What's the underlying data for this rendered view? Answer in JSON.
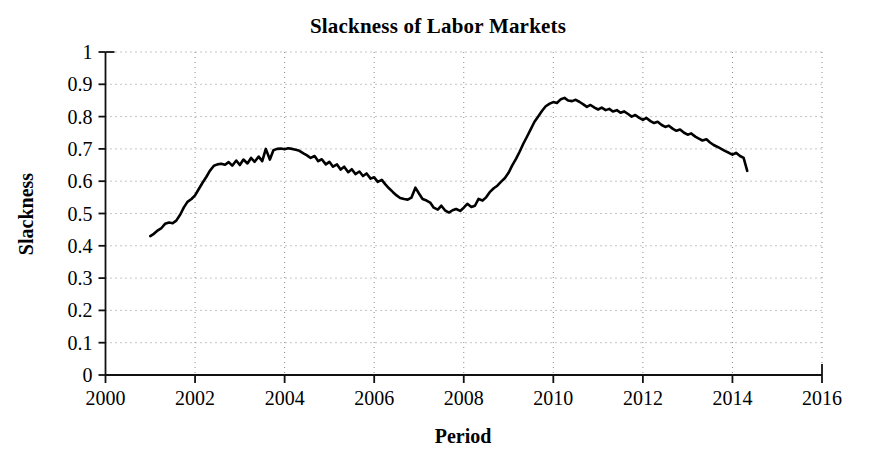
{
  "chart_data": {
    "type": "line",
    "title": "Slackness of Labor Markets",
    "xlabel": "Period",
    "ylabel": "Slackness",
    "xlim": [
      2000,
      2016
    ],
    "ylim": [
      0,
      1
    ],
    "xticks": [
      "2000",
      "2002",
      "2004",
      "2006",
      "2008",
      "2010",
      "2012",
      "2014",
      "2016"
    ],
    "xtick_values": [
      2000,
      2002,
      2004,
      2006,
      2008,
      2010,
      2012,
      2014,
      2016
    ],
    "yticks": [
      "0",
      "0.1",
      "0.2",
      "0.3",
      "0.4",
      "0.5",
      "0.6",
      "0.7",
      "0.8",
      "0.9",
      "1"
    ],
    "ytick_values": [
      0,
      0.1,
      0.2,
      0.3,
      0.4,
      0.5,
      0.6,
      0.7,
      0.8,
      0.9,
      1
    ],
    "grid": "dotted both axes",
    "legend": "none",
    "line_color": "#000000",
    "line_width": 2.6,
    "series": [
      {
        "name": "Slackness",
        "x": [
          2001.0,
          2001.08,
          2001.17,
          2001.25,
          2001.33,
          2001.42,
          2001.5,
          2001.58,
          2001.67,
          2001.75,
          2001.83,
          2001.92,
          2002.0,
          2002.08,
          2002.17,
          2002.25,
          2002.33,
          2002.42,
          2002.5,
          2002.58,
          2002.67,
          2002.75,
          2002.83,
          2002.92,
          2003.0,
          2003.08,
          2003.17,
          2003.25,
          2003.33,
          2003.42,
          2003.5,
          2003.58,
          2003.67,
          2003.75,
          2003.83,
          2003.92,
          2004.0,
          2004.08,
          2004.17,
          2004.25,
          2004.33,
          2004.42,
          2004.5,
          2004.58,
          2004.67,
          2004.75,
          2004.83,
          2004.92,
          2005.0,
          2005.08,
          2005.17,
          2005.25,
          2005.33,
          2005.42,
          2005.5,
          2005.58,
          2005.67,
          2005.75,
          2005.83,
          2005.92,
          2006.0,
          2006.08,
          2006.17,
          2006.25,
          2006.33,
          2006.42,
          2006.5,
          2006.58,
          2006.67,
          2006.75,
          2006.83,
          2006.92,
          2007.0,
          2007.08,
          2007.17,
          2007.25,
          2007.33,
          2007.42,
          2007.5,
          2007.58,
          2007.67,
          2007.75,
          2007.83,
          2007.92,
          2008.0,
          2008.08,
          2008.17,
          2008.25,
          2008.33,
          2008.42,
          2008.5,
          2008.58,
          2008.67,
          2008.75,
          2008.83,
          2008.92,
          2009.0,
          2009.08,
          2009.17,
          2009.25,
          2009.33,
          2009.42,
          2009.5,
          2009.58,
          2009.67,
          2009.75,
          2009.83,
          2009.92,
          2010.0,
          2010.08,
          2010.17,
          2010.25,
          2010.33,
          2010.42,
          2010.5,
          2010.58,
          2010.67,
          2010.75,
          2010.83,
          2010.92,
          2011.0,
          2011.08,
          2011.17,
          2011.25,
          2011.33,
          2011.42,
          2011.5,
          2011.58,
          2011.67,
          2011.75,
          2011.83,
          2011.92,
          2012.0,
          2012.08,
          2012.17,
          2012.25,
          2012.33,
          2012.42,
          2012.5,
          2012.58,
          2012.67,
          2012.75,
          2012.83,
          2012.92,
          2013.0,
          2013.08,
          2013.17,
          2013.25,
          2013.33,
          2013.42,
          2013.5,
          2013.58,
          2013.67,
          2013.75,
          2013.83,
          2013.92,
          2014.0,
          2014.08,
          2014.17,
          2014.25,
          2014.33
        ],
        "values": [
          0.43,
          0.437,
          0.448,
          0.455,
          0.468,
          0.472,
          0.47,
          0.478,
          0.497,
          0.519,
          0.536,
          0.545,
          0.556,
          0.575,
          0.596,
          0.613,
          0.632,
          0.648,
          0.652,
          0.654,
          0.651,
          0.659,
          0.648,
          0.664,
          0.65,
          0.667,
          0.655,
          0.672,
          0.66,
          0.676,
          0.662,
          0.7,
          0.667,
          0.696,
          0.7,
          0.701,
          0.699,
          0.702,
          0.7,
          0.697,
          0.694,
          0.686,
          0.68,
          0.672,
          0.678,
          0.662,
          0.668,
          0.652,
          0.66,
          0.645,
          0.652,
          0.636,
          0.645,
          0.628,
          0.637,
          0.622,
          0.63,
          0.616,
          0.624,
          0.608,
          0.612,
          0.598,
          0.604,
          0.59,
          0.578,
          0.566,
          0.556,
          0.548,
          0.545,
          0.543,
          0.549,
          0.58,
          0.562,
          0.545,
          0.54,
          0.534,
          0.518,
          0.512,
          0.524,
          0.51,
          0.503,
          0.51,
          0.514,
          0.508,
          0.518,
          0.53,
          0.52,
          0.524,
          0.545,
          0.54,
          0.55,
          0.566,
          0.578,
          0.586,
          0.598,
          0.61,
          0.626,
          0.648,
          0.67,
          0.692,
          0.716,
          0.74,
          0.762,
          0.784,
          0.802,
          0.818,
          0.832,
          0.84,
          0.845,
          0.842,
          0.854,
          0.858,
          0.85,
          0.848,
          0.852,
          0.846,
          0.838,
          0.83,
          0.836,
          0.828,
          0.822,
          0.828,
          0.82,
          0.824,
          0.816,
          0.82,
          0.812,
          0.816,
          0.808,
          0.8,
          0.805,
          0.796,
          0.79,
          0.796,
          0.786,
          0.78,
          0.784,
          0.774,
          0.768,
          0.772,
          0.762,
          0.756,
          0.76,
          0.75,
          0.744,
          0.748,
          0.738,
          0.732,
          0.726,
          0.73,
          0.72,
          0.712,
          0.706,
          0.7,
          0.694,
          0.688,
          0.682,
          0.688,
          0.678,
          0.672,
          0.632
        ]
      }
    ]
  },
  "axes": {
    "y_axis_title": "Slackness",
    "x_axis_title": "Period"
  }
}
